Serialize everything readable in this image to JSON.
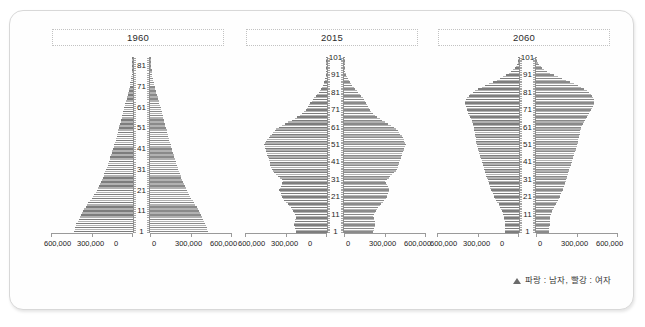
{
  "panel": {
    "legend": {
      "marker": "triangle-marker",
      "text": "파랑 : 남자,  빨강 : 여자"
    }
  },
  "chart_data": [
    {
      "type": "bar",
      "title": "1960",
      "orientation": "population-pyramid",
      "xlabel": "",
      "ylabel": "",
      "grid": false,
      "legend_position": "bottom-right",
      "xlim": [
        -600000,
        600000
      ],
      "xticks_left": [
        "600,000",
        "300,000",
        "0"
      ],
      "xticks_right": [
        "0",
        "300,000",
        "600,000"
      ],
      "yticks": [
        "1",
        "11",
        "21",
        "31",
        "41",
        "51",
        "61",
        "71",
        "81"
      ],
      "ylim": [
        1,
        85
      ],
      "age_min": 1,
      "age_max": 85,
      "series": [
        {
          "name": "남자",
          "side": "left",
          "color": "#7d7d7d",
          "values": [
            432000,
            428000,
            424000,
            420000,
            414000,
            406000,
            398000,
            390000,
            382000,
            374000,
            366000,
            356000,
            346000,
            336000,
            326000,
            314000,
            302000,
            292000,
            282000,
            274000,
            266000,
            258000,
            250000,
            243000,
            236000,
            229000,
            222000,
            215000,
            209000,
            203000,
            197000,
            191000,
            186000,
            181000,
            176000,
            171000,
            166000,
            161000,
            156000,
            151000,
            147000,
            142000,
            137000,
            133000,
            128000,
            124000,
            119000,
            115000,
            111000,
            107000,
            103000,
            99000,
            95000,
            91000,
            87000,
            83000,
            79000,
            75000,
            71000,
            67000,
            63000,
            59000,
            55000,
            51000,
            47000,
            43000,
            39000,
            35000,
            31000,
            28000,
            25000,
            22000,
            19000,
            17000,
            14000,
            12000,
            10000,
            8000,
            7000,
            5500,
            4500,
            3500,
            2800,
            2200,
            1700
          ]
        },
        {
          "name": "여자",
          "side": "right",
          "color": "#8a8a8a",
          "values": [
            421000,
            418000,
            414000,
            410000,
            405000,
            398000,
            390000,
            383000,
            375000,
            367000,
            359000,
            350000,
            341000,
            332000,
            322000,
            311000,
            300000,
            291000,
            282000,
            275000,
            268000,
            261000,
            254000,
            248000,
            242000,
            236000,
            230000,
            224000,
            218000,
            213000,
            208000,
            203000,
            198000,
            193000,
            188000,
            183000,
            178000,
            173000,
            169000,
            164000,
            160000,
            155000,
            151000,
            146000,
            142000,
            138000,
            133000,
            129000,
            125000,
            121000,
            117000,
            113000,
            109000,
            105000,
            101000,
            97000,
            93000,
            89000,
            85000,
            81000,
            77000,
            73000,
            69000,
            65000,
            60000,
            56000,
            52000,
            47000,
            43000,
            39000,
            35000,
            31000,
            28000,
            24000,
            21000,
            18000,
            15000,
            13000,
            11000,
            9000,
            7500,
            6000,
            4800,
            3800,
            3000
          ]
        }
      ]
    },
    {
      "type": "bar",
      "title": "2015",
      "orientation": "population-pyramid",
      "xlabel": "",
      "ylabel": "",
      "grid": false,
      "legend_position": "bottom-right",
      "xlim": [
        -600000,
        600000
      ],
      "xticks_left": [
        "600,000",
        "300,000",
        "0"
      ],
      "xticks_right": [
        "0",
        "300,000",
        "600,000"
      ],
      "yticks": [
        "1",
        "11",
        "21",
        "31",
        "41",
        "51",
        "61",
        "71",
        "81",
        "91",
        "101"
      ],
      "ylim": [
        1,
        101
      ],
      "age_min": 1,
      "age_max": 101,
      "series": [
        {
          "name": "남자",
          "side": "left",
          "color": "#7d7d7d",
          "values": [
            225000,
            228000,
            232000,
            236000,
            240000,
            240000,
            236000,
            232000,
            228000,
            224000,
            232000,
            240000,
            248000,
            256000,
            264000,
            276000,
            288000,
            300000,
            312000,
            324000,
            330000,
            336000,
            340000,
            344000,
            348000,
            344000,
            338000,
            332000,
            326000,
            320000,
            330000,
            344000,
            358000,
            372000,
            386000,
            396000,
            404000,
            410000,
            414000,
            418000,
            420000,
            424000,
            428000,
            432000,
            436000,
            440000,
            444000,
            448000,
            452000,
            456000,
            458000,
            452000,
            444000,
            436000,
            428000,
            418000,
            406000,
            394000,
            382000,
            370000,
            352000,
            330000,
            306000,
            282000,
            258000,
            236000,
            216000,
            198000,
            182000,
            168000,
            156000,
            146000,
            138000,
            130000,
            122000,
            112000,
            102000,
            92000,
            82000,
            72000,
            62000,
            53000,
            45000,
            38000,
            31000,
            25000,
            20000,
            16000,
            12500,
            9500,
            7000,
            5200,
            3800,
            2700,
            1900,
            1300,
            900,
            600,
            400,
            250,
            150
          ]
        },
        {
          "name": "여자",
          "side": "right",
          "color": "#8a8a8a",
          "values": [
            213000,
            216000,
            220000,
            224000,
            228000,
            228000,
            224000,
            220000,
            216000,
            212000,
            220000,
            228000,
            236000,
            244000,
            252000,
            262000,
            272000,
            284000,
            296000,
            306000,
            312000,
            318000,
            322000,
            326000,
            330000,
            326000,
            320000,
            314000,
            308000,
            302000,
            312000,
            326000,
            340000,
            354000,
            368000,
            378000,
            386000,
            392000,
            398000,
            402000,
            406000,
            410000,
            414000,
            418000,
            422000,
            428000,
            432000,
            438000,
            442000,
            448000,
            452000,
            448000,
            442000,
            436000,
            430000,
            422000,
            412000,
            402000,
            392000,
            382000,
            366000,
            346000,
            324000,
            302000,
            280000,
            260000,
            242000,
            226000,
            212000,
            200000,
            190000,
            182000,
            176000,
            170000,
            164000,
            156000,
            146000,
            136000,
            126000,
            116000,
            104000,
            92000,
            81000,
            70000,
            60000,
            50000,
            42000,
            34000,
            27000,
            21000,
            16000,
            12000,
            9000,
            6500,
            4600,
            3200,
            2200,
            1500,
            1000,
            650,
            400
          ]
        }
      ]
    },
    {
      "type": "bar",
      "title": "2060",
      "orientation": "population-pyramid",
      "xlabel": "",
      "ylabel": "",
      "grid": false,
      "legend_position": "bottom-right",
      "xlim": [
        -600000,
        600000
      ],
      "xticks_left": [
        "600,000",
        "300,000",
        "0"
      ],
      "xticks_right": [
        "0",
        "300,000",
        "600,000"
      ],
      "yticks": [
        "1",
        "11",
        "21",
        "31",
        "41",
        "51",
        "61",
        "71",
        "81",
        "91",
        "101"
      ],
      "ylim": [
        1,
        101
      ],
      "age_min": 1,
      "age_max": 101,
      "series": [
        {
          "name": "남자",
          "side": "left",
          "color": "#7d7d7d",
          "values": [
            100000,
            101000,
            102000,
            103000,
            104000,
            105000,
            106000,
            107000,
            108000,
            110000,
            114000,
            119000,
            124000,
            130000,
            136000,
            143000,
            150000,
            158000,
            166000,
            174000,
            180000,
            186000,
            192000,
            198000,
            204000,
            210000,
            214000,
            218000,
            222000,
            226000,
            230000,
            234000,
            238000,
            242000,
            246000,
            250000,
            254000,
            258000,
            262000,
            266000,
            270000,
            274000,
            278000,
            282000,
            286000,
            290000,
            294000,
            298000,
            302000,
            306000,
            310000,
            312000,
            314000,
            316000,
            318000,
            320000,
            322000,
            324000,
            326000,
            328000,
            330000,
            334000,
            338000,
            342000,
            346000,
            352000,
            358000,
            364000,
            370000,
            376000,
            380000,
            384000,
            388000,
            392000,
            396000,
            392000,
            386000,
            378000,
            368000,
            356000,
            340000,
            320000,
            298000,
            274000,
            248000,
            220000,
            192000,
            164000,
            138000,
            114000,
            92000,
            72000,
            55000,
            41000,
            30000,
            21000,
            14500,
            9500,
            6000,
            3600,
            2000
          ]
        },
        {
          "name": "여자",
          "side": "right",
          "color": "#8a8a8a",
          "values": [
            95000,
            96000,
            97000,
            98000,
            99000,
            100000,
            101000,
            102000,
            103000,
            105000,
            109000,
            114000,
            119000,
            124000,
            130000,
            137000,
            144000,
            151000,
            159000,
            166000,
            172000,
            178000,
            184000,
            190000,
            196000,
            201000,
            205000,
            209000,
            213000,
            217000,
            221000,
            225000,
            229000,
            233000,
            237000,
            241000,
            245000,
            249000,
            253000,
            257000,
            261000,
            265000,
            269000,
            273000,
            277000,
            281000,
            285000,
            289000,
            293000,
            297000,
            301000,
            304000,
            307000,
            310000,
            313000,
            316000,
            319000,
            322000,
            325000,
            328000,
            332000,
            338000,
            344000,
            350000,
            358000,
            366000,
            374000,
            382000,
            390000,
            398000,
            404000,
            410000,
            416000,
            422000,
            428000,
            428000,
            424000,
            418000,
            410000,
            400000,
            388000,
            372000,
            352000,
            330000,
            306000,
            278000,
            248000,
            218000,
            188000,
            158000,
            130000,
            104000,
            81000,
            62000,
            46000,
            33000,
            23000,
            15500,
            10000,
            6200,
            3600
          ]
        }
      ]
    }
  ]
}
